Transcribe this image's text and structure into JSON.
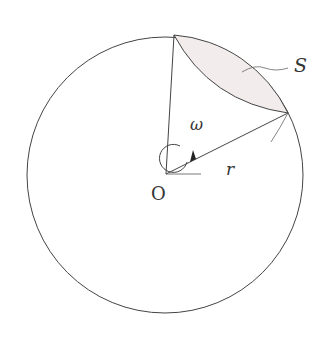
{
  "diagram": {
    "labels": {
      "shaded_region": "S",
      "angular_velocity": "ω",
      "radius": "r",
      "center": "O"
    },
    "colors": {
      "stroke": "#444444",
      "shade": "#f3ecec",
      "background": "#ffffff"
    }
  }
}
